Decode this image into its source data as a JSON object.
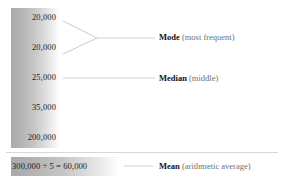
{
  "figure": {
    "values": [
      {
        "text": "20,000",
        "number": 20000
      },
      {
        "text": "20,000",
        "number": 20000
      },
      {
        "text": "25,000",
        "number": 25000
      },
      {
        "text": "35,000",
        "number": 35000
      },
      {
        "text": "200,000",
        "number": 200000
      }
    ],
    "mean_equation": "300,000 ÷ 5 = 60,000",
    "labels": {
      "mode": {
        "term": "Mode",
        "paren": " (most frequent)"
      },
      "median": {
        "term": "Median",
        "paren": " (middle)"
      },
      "mean": {
        "term": "Mean",
        "paren": " (arithmetic average)"
      }
    },
    "colors": {
      "gradient_dark": "#a9a9a9",
      "gradient_light": "#ffffff",
      "text": "#1d1d1d",
      "term_text": "#121212",
      "paren_text": "#6f6f6f",
      "connector_line": "#cfcfcf",
      "separator": "#d8d8d8"
    }
  }
}
